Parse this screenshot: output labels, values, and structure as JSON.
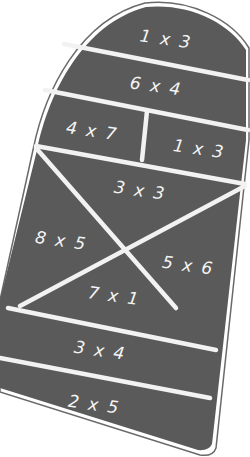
{
  "board": {
    "description": "Hopscotch grid with multiplication facts",
    "fill_color": "#5a5a5a",
    "line_color": "#f2f2f2",
    "outline_color": "#6a6a6a"
  },
  "cells": [
    {
      "id": "top-dome",
      "label": "1 x 3"
    },
    {
      "id": "row-2",
      "label": "6 x 4"
    },
    {
      "id": "row-3-left",
      "label": "4 x 7"
    },
    {
      "id": "row-3-right",
      "label": "1 x 3"
    },
    {
      "id": "x-top",
      "label": "3 x 3"
    },
    {
      "id": "x-left",
      "label": "8 x 5"
    },
    {
      "id": "x-right",
      "label": "5 x 6"
    },
    {
      "id": "x-bottom",
      "label": "7 x 1"
    },
    {
      "id": "row-5",
      "label": "3 x 4"
    },
    {
      "id": "row-6",
      "label": "2 x 5"
    }
  ]
}
